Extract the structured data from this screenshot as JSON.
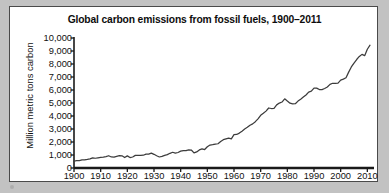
{
  "page": {
    "background_color": "#c2c2c2",
    "paper_color": "#ffffff",
    "border_color": "#4a4a4a"
  },
  "chart_data": {
    "type": "line",
    "title": "Global carbon emissions from fossil fuels, 1900–2011",
    "xlabel": "",
    "ylabel": "Million metric tons carbon",
    "xlim": [
      1900,
      2011
    ],
    "ylim": [
      0,
      10000
    ],
    "grid": false,
    "legend": null,
    "line_color": "#3c3c3c",
    "xticks": [
      1900,
      1910,
      1920,
      1930,
      1940,
      1950,
      1960,
      1970,
      1980,
      1990,
      2000,
      2010
    ],
    "xtick_labels": [
      "1900",
      "1910",
      "1920",
      "1930",
      "1940",
      "1950",
      "1960",
      "1970",
      "1980",
      "1990",
      "2000",
      "2010"
    ],
    "yticks": [
      0,
      1000,
      2000,
      3000,
      4000,
      5000,
      6000,
      7000,
      8000,
      9000,
      10000
    ],
    "ytick_labels": [
      "0",
      "1,000",
      "2,000",
      "3,000",
      "4,000",
      "5,000",
      "6,000",
      "7,000",
      "8,000",
      "9,000",
      "10,000"
    ],
    "series": [
      {
        "name": "Global carbon emissions from fossil fuels",
        "x": [
          1900,
          1901,
          1902,
          1903,
          1904,
          1905,
          1906,
          1907,
          1908,
          1909,
          1910,
          1911,
          1912,
          1913,
          1914,
          1915,
          1916,
          1917,
          1918,
          1919,
          1920,
          1921,
          1922,
          1923,
          1924,
          1925,
          1926,
          1927,
          1928,
          1929,
          1930,
          1931,
          1932,
          1933,
          1934,
          1935,
          1936,
          1937,
          1938,
          1939,
          1940,
          1941,
          1942,
          1943,
          1944,
          1945,
          1946,
          1947,
          1948,
          1949,
          1950,
          1951,
          1952,
          1953,
          1954,
          1955,
          1956,
          1957,
          1958,
          1959,
          1960,
          1961,
          1962,
          1963,
          1964,
          1965,
          1966,
          1967,
          1968,
          1969,
          1970,
          1971,
          1972,
          1973,
          1974,
          1975,
          1976,
          1977,
          1978,
          1979,
          1980,
          1981,
          1982,
          1983,
          1984,
          1985,
          1986,
          1987,
          1988,
          1989,
          1990,
          1991,
          1992,
          1993,
          1994,
          1995,
          1996,
          1997,
          1998,
          1999,
          2000,
          2001,
          2002,
          2003,
          2004,
          2005,
          2006,
          2007,
          2008,
          2009,
          2010,
          2011
        ],
        "values": [
          534,
          566,
          574,
          624,
          627,
          661,
          705,
          784,
          750,
          785,
          819,
          836,
          879,
          943,
          850,
          838,
          901,
          955,
          936,
          806,
          932,
          803,
          845,
          970,
          963,
          975,
          983,
          1062,
          1065,
          1145,
          1053,
          940,
          847,
          893,
          973,
          1027,
          1130,
          1209,
          1142,
          1192,
          1299,
          1334,
          1342,
          1391,
          1383,
          1160,
          1238,
          1392,
          1469,
          1419,
          1630,
          1767,
          1795,
          1841,
          1865,
          2043,
          2179,
          2240,
          2295,
          2242,
          2569,
          2580,
          2686,
          2833,
          2995,
          3130,
          3288,
          3393,
          3565,
          3780,
          4053,
          4208,
          4376,
          4616,
          4576,
          4580,
          4856,
          4993,
          5075,
          5323,
          5150,
          4985,
          4934,
          4944,
          5147,
          5297,
          5459,
          5617,
          5840,
          5910,
          6143,
          6145,
          6034,
          6028,
          6115,
          6231,
          6434,
          6517,
          6510,
          6525,
          6765,
          6838,
          6938,
          7376,
          7772,
          8075,
          8344,
          8580,
          8740,
          8640,
          9137,
          9449
        ]
      }
    ]
  }
}
